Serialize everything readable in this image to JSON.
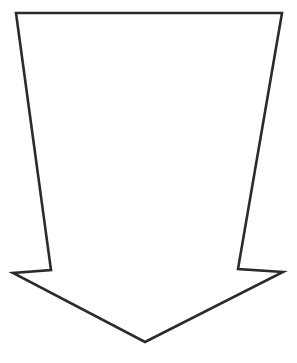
{
  "page": {
    "background_color": "#ffffff",
    "width": 297,
    "height": 363
  },
  "header": {
    "watermark_text": "DOWNWARD ARROW",
    "watermark_color": "#f2f2f3"
  },
  "diagram": {
    "name": "downward-tapering-block-arrow",
    "title": "Downward Arrow",
    "fill_color": "#ffffff",
    "stroke_color": "#2b2b2b",
    "stroke_width": 2.6,
    "orientation": "down",
    "vertices": [
      {
        "name": "top-left",
        "x": 16,
        "y": 13
      },
      {
        "name": "top-right",
        "x": 282,
        "y": 13
      },
      {
        "name": "shaft-right-shoulder",
        "x": 238,
        "y": 269
      },
      {
        "name": "barb-right-tip",
        "x": 283,
        "y": 272
      },
      {
        "name": "arrow-apex",
        "x": 145,
        "y": 342
      },
      {
        "name": "barb-left-tip",
        "x": 13,
        "y": 273
      },
      {
        "name": "shaft-left-shoulder",
        "x": 51,
        "y": 270
      }
    ],
    "measurements": {
      "top_edge_width": 266,
      "shaft_width_at_shoulders": 187,
      "arrowhead_span": 270,
      "total_height": 329
    }
  }
}
